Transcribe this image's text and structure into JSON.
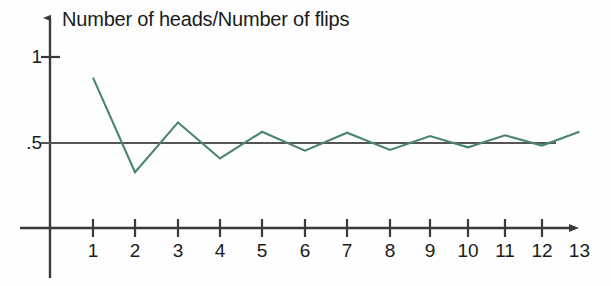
{
  "chart_data": {
    "type": "line",
    "title": "Number of heads/Number of flips",
    "xlabel": "",
    "ylabel": "Number of heads/Number of flips",
    "x": [
      1,
      2,
      3,
      4,
      5,
      6,
      7,
      8,
      9,
      10,
      11,
      12,
      13
    ],
    "values": [
      0.88,
      0.33,
      0.62,
      0.41,
      0.565,
      0.455,
      0.56,
      0.46,
      0.54,
      0.475,
      0.545,
      0.485,
      0.565
    ],
    "categories": [
      "1",
      "2",
      "3",
      "4",
      "5",
      "6",
      "7",
      "8",
      "9",
      "10",
      "11",
      "12",
      "13"
    ],
    "xtick_labels": [
      "1",
      "2",
      "3",
      "4",
      "5",
      "6",
      "7",
      "8",
      "9",
      "10",
      "11",
      "12",
      "13"
    ],
    "ytick_labels": [
      "1",
      ".5"
    ],
    "ytick_values": [
      1,
      0.5
    ],
    "xlim": [
      0,
      13.85
    ],
    "ylim": [
      0,
      1.12
    ],
    "grid": false,
    "legend": null,
    "reference_line": {
      "label": ".5",
      "value": 0.5,
      "color": "#555555"
    },
    "series_color": "#4a8570",
    "axis_color": "#3a3a3a",
    "series_name": "Number of heads/Number of flips"
  },
  "axes": {
    "title": "Number of heads/Number of flips",
    "y_labels": {
      "one": "1",
      "half": ".5"
    },
    "x_labels": [
      "1",
      "2",
      "3",
      "4",
      "5",
      "6",
      "7",
      "8",
      "9",
      "10",
      "11",
      "12",
      "13"
    ]
  }
}
